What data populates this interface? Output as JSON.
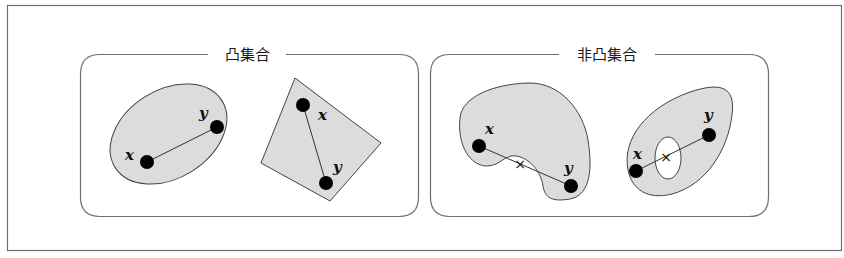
{
  "figure": {
    "background": "#ffffff",
    "frame_color": "#6e6e6e",
    "shape_fill": "#dcdcdc",
    "shape_stroke": "#444444",
    "point_color": "#000000"
  },
  "panels": [
    {
      "title": "凸集合",
      "shapes": [
        {
          "kind": "ellipse",
          "points": [
            {
              "label": "x"
            },
            {
              "label": "y"
            }
          ]
        },
        {
          "kind": "quadrilateral",
          "points": [
            {
              "label": "x"
            },
            {
              "label": "y"
            }
          ]
        }
      ]
    },
    {
      "title": "非凸集合",
      "shapes": [
        {
          "kind": "bean",
          "points": [
            {
              "label": "x"
            },
            {
              "label": "y"
            }
          ],
          "outside_marker": "×"
        },
        {
          "kind": "ellipse-with-hole",
          "points": [
            {
              "label": "x"
            },
            {
              "label": "y"
            }
          ],
          "outside_marker": "×"
        }
      ]
    }
  ]
}
